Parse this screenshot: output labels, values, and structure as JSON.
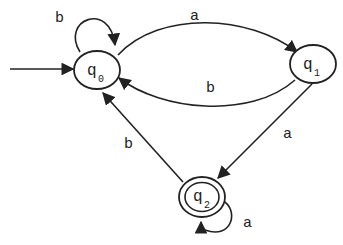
{
  "diagram": {
    "type": "DFA",
    "states": [
      {
        "id": "q0",
        "label": "q",
        "sub": "0",
        "initial": true,
        "accepting": false
      },
      {
        "id": "q1",
        "label": "q",
        "sub": "1",
        "initial": false,
        "accepting": false
      },
      {
        "id": "q2",
        "label": "q",
        "sub": "2",
        "initial": false,
        "accepting": true
      }
    ],
    "transitions": [
      {
        "from": "q0",
        "to": "q0",
        "label": "b"
      },
      {
        "from": "q0",
        "to": "q1",
        "label": "a"
      },
      {
        "from": "q1",
        "to": "q0",
        "label": "b"
      },
      {
        "from": "q1",
        "to": "q2",
        "label": "a"
      },
      {
        "from": "q2",
        "to": "q0",
        "label": "b"
      },
      {
        "from": "q2",
        "to": "q2",
        "label": "a"
      }
    ]
  }
}
